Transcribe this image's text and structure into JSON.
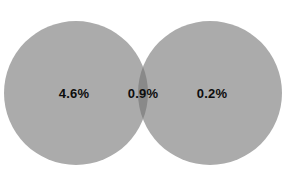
{
  "figure": {
    "type": "venn-diagram",
    "background_color": "#ffffff",
    "width": 286,
    "height": 187
  },
  "chart_data": {
    "type": "venn",
    "title": "",
    "subtitle": "",
    "xlabel": "",
    "ylabel": "",
    "grid": false,
    "legend": false,
    "sets": [
      {
        "id": "left",
        "label": "",
        "value_label": "4.6%",
        "value": 4.6,
        "units": "percent",
        "fill_color": "#ababab",
        "center_x": 76,
        "center_y": 93,
        "radius": 72
      },
      {
        "id": "right",
        "label": "",
        "value_label": "0.2%",
        "value": 0.2,
        "units": "percent",
        "fill_color": "#ababab",
        "center_x": 210,
        "center_y": 93,
        "radius": 72
      }
    ],
    "intersection": {
      "id": "left-right",
      "label": "",
      "value_label": "0.9%",
      "value": 0.9,
      "units": "percent",
      "fill_color": "#898989",
      "center_x": 143,
      "center_y": 93
    },
    "labels": [
      {
        "text": "4.6%",
        "x": 74,
        "y": 93
      },
      {
        "text": "0.9%",
        "x": 143,
        "y": 93
      },
      {
        "text": "0.2%",
        "x": 212,
        "y": 93
      }
    ],
    "label_color": "#0d0d0d"
  }
}
